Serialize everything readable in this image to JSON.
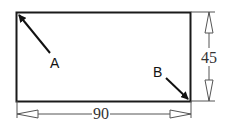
{
  "diagram": {
    "type": "dimensioned-rectangle",
    "rectangle": {
      "width_label": "90",
      "height_label": "45"
    },
    "points": [
      {
        "label": "A",
        "position": "top-left-corner"
      },
      {
        "label": "B",
        "position": "bottom-right-corner"
      }
    ],
    "dimensions": {
      "horizontal": "90",
      "vertical": "45"
    },
    "colors": {
      "stroke": "#1a1a1a",
      "dimension_stroke": "#555555",
      "background": "#ffffff"
    }
  }
}
